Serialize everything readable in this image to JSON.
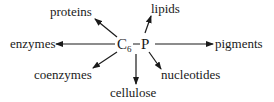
{
  "diagram": {
    "center": {
      "left_symbol": "C",
      "left_subscript": "6",
      "connector": "–",
      "right_symbol": "P"
    },
    "products": [
      {
        "id": "proteins",
        "label": "proteins",
        "from": "C6"
      },
      {
        "id": "lipids",
        "label": "lipids",
        "from": "P"
      },
      {
        "id": "enzymes",
        "label": "enzymes",
        "from": "C6"
      },
      {
        "id": "pigments",
        "label": "pigments",
        "from": "P"
      },
      {
        "id": "coenzymes",
        "label": "coenzymes",
        "from": "C6"
      },
      {
        "id": "cellulose",
        "label": "cellulose",
        "from": "C6"
      },
      {
        "id": "nucleotides",
        "label": "nucleotides",
        "from": "P"
      }
    ],
    "colors": {
      "ink": "#1a1a1a",
      "background": "#ffffff"
    }
  }
}
